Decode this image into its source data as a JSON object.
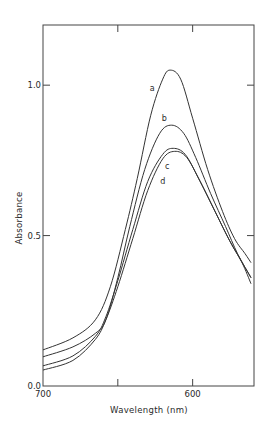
{
  "chart_data": {
    "type": "line",
    "title": "",
    "xlabel": "Wavelength  (nm)",
    "ylabel": "Absorbance",
    "xlim": [
      700,
      559
    ],
    "ylim": [
      0.0,
      1.2
    ],
    "x_reversed": true,
    "grid": false,
    "legend": "none (inline curve labels)",
    "x_ticks": [
      {
        "value": 700,
        "label": "700"
      },
      {
        "value": 650,
        "label": ""
      },
      {
        "value": 600,
        "label": "600"
      }
    ],
    "y_ticks": [
      {
        "value": 0.0,
        "label": "0.0"
      },
      {
        "value": 0.5,
        "label": "0.5"
      },
      {
        "value": 1.0,
        "label": "1.0"
      }
    ],
    "series": [
      {
        "name": "a",
        "x": [
          700,
          680,
          665,
          655,
          645,
          637,
          628,
          620,
          615,
          608,
          600,
          590,
          580,
          572,
          565,
          561
        ],
        "y": [
          0.12,
          0.16,
          0.22,
          0.33,
          0.52,
          0.69,
          0.9,
          1.02,
          1.05,
          1.02,
          0.89,
          0.72,
          0.58,
          0.49,
          0.44,
          0.41
        ],
        "label_at": {
          "x": 627,
          "y": 0.98
        }
      },
      {
        "name": "b",
        "x": [
          700,
          680,
          665,
          658,
          650,
          642,
          632,
          622,
          614,
          606,
          598,
          588,
          578,
          570,
          561
        ],
        "y": [
          0.097,
          0.13,
          0.175,
          0.22,
          0.36,
          0.53,
          0.72,
          0.84,
          0.867,
          0.84,
          0.76,
          0.64,
          0.53,
          0.44,
          0.36
        ],
        "label_at": {
          "x": 619,
          "y": 0.88
        }
      },
      {
        "name": "c",
        "x": [
          700,
          680,
          665,
          658,
          650,
          640,
          630,
          620,
          613,
          605,
          596,
          586,
          576,
          568,
          561
        ],
        "y": [
          0.067,
          0.1,
          0.165,
          0.23,
          0.35,
          0.52,
          0.68,
          0.77,
          0.79,
          0.77,
          0.69,
          0.59,
          0.49,
          0.42,
          0.36
        ],
        "label_at": {
          "x": 617,
          "y": 0.72
        }
      },
      {
        "name": "d",
        "x": [
          700,
          680,
          665,
          658,
          650,
          640,
          630,
          620,
          612,
          604,
          595,
          585,
          575,
          567,
          561
        ],
        "y": [
          0.053,
          0.085,
          0.155,
          0.22,
          0.33,
          0.49,
          0.65,
          0.755,
          0.78,
          0.76,
          0.68,
          0.58,
          0.48,
          0.41,
          0.34
        ],
        "label_at": {
          "x": 620,
          "y": 0.67
        }
      }
    ]
  }
}
